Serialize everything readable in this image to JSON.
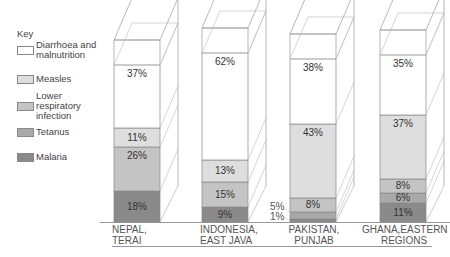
{
  "chart_data": {
    "type": "bar",
    "stacked": true,
    "percent_stacked": true,
    "title": "",
    "xlabel": "",
    "ylabel": "",
    "legend_title": "Key",
    "legend_position": "left",
    "categories": [
      "NEPAL, TERAI",
      "INDONESIA, EAST JAVA",
      "PAKISTAN, PUNJAB",
      "GHANA, EASTERN REGIONS"
    ],
    "series": [
      {
        "name": "Malaria",
        "color": "#8a8a8a",
        "values": [
          18,
          9,
          1,
          11
        ]
      },
      {
        "name": "Tetanus",
        "color": "#a9a9a9",
        "values": [
          0,
          0,
          5,
          6
        ]
      },
      {
        "name": "Lower respiratory infection",
        "color": "#c4c4c4",
        "values": [
          26,
          15,
          8,
          8
        ]
      },
      {
        "name": "Measles",
        "color": "#dedede",
        "values": [
          11,
          13,
          43,
          37
        ]
      },
      {
        "name": "Diarrhoea and malnutrition",
        "color": "#ffffff",
        "values": [
          37,
          62,
          38,
          35
        ]
      }
    ],
    "ylim": [
      0,
      100
    ],
    "grid": false
  },
  "key": {
    "title": "Key",
    "items": [
      {
        "label": "Diarrhoea and malnutrition",
        "color": "#ffffff"
      },
      {
        "label": "Measles",
        "color": "#dedede"
      },
      {
        "label": "Lower respiratory infection",
        "color": "#c4c4c4"
      },
      {
        "label": "Tetanus",
        "color": "#a9a9a9"
      },
      {
        "label": "Malaria",
        "color": "#8a8a8a"
      }
    ]
  },
  "bars": [
    {
      "label_line1": "NEPAL,",
      "label_line2": "TERAI",
      "segments": [
        {
          "text": "18%",
          "color": "#8a8a8a",
          "h": 31
        },
        {
          "text": "26%",
          "color": "#c4c4c4",
          "h": 44
        },
        {
          "text": "11%",
          "color": "#dedede",
          "h": 19
        },
        {
          "text": "37%",
          "color": "#ffffff",
          "h": 63
        }
      ]
    },
    {
      "label_line1": "INDONESIA,",
      "label_line2": "EAST JAVA",
      "segments": [
        {
          "text": "9%",
          "color": "#8a8a8a",
          "h": 15
        },
        {
          "text": "15%",
          "color": "#c4c4c4",
          "h": 25
        },
        {
          "text": "13%",
          "color": "#dedede",
          "h": 22
        },
        {
          "text": "62%",
          "color": "#ffffff",
          "h": 107
        }
      ]
    },
    {
      "label_line1": "PAKISTAN,",
      "label_line2": "PUNJAB",
      "segments": [
        {
          "text": "",
          "color": "#8a8a8a",
          "h": 3
        },
        {
          "text": "",
          "color": "#a9a9a9",
          "h": 7
        },
        {
          "text": "8%",
          "color": "#c4c4c4",
          "h": 14
        },
        {
          "text": "43%",
          "color": "#dedede",
          "h": 74
        },
        {
          "text": "38%",
          "color": "#ffffff",
          "h": 65
        }
      ]
    },
    {
      "label_line1": "GHANA,EASTERN",
      "label_line2": "REGIONS",
      "segments": [
        {
          "text": "11%",
          "color": "#8a8a8a",
          "h": 19
        },
        {
          "text": "6%",
          "color": "#a9a9a9",
          "h": 10
        },
        {
          "text": "8%",
          "color": "#c4c4c4",
          "h": 14
        },
        {
          "text": "37%",
          "color": "#dedede",
          "h": 64
        },
        {
          "text": "35%",
          "color": "#ffffff",
          "h": 60
        }
      ]
    }
  ],
  "side_labels": {
    "pakistan_tetanus": "5%",
    "pakistan_malaria": "1%"
  }
}
